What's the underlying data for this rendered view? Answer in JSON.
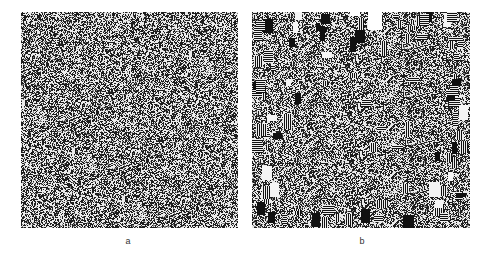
{
  "figure": {
    "panels": [
      {
        "id": "a",
        "label": "a",
        "pattern": "uniform-random-binary-noise",
        "cell_px": 1,
        "gray_levels": [
          "#1a1a1a",
          "#7a7a7a",
          "#e6e6e6"
        ]
      },
      {
        "id": "b",
        "label": "b",
        "pattern": "random-noise-with-striped-block-artifacts",
        "cell_px": 1,
        "block_density_edges": "high",
        "block_density_center": "low",
        "gray_levels": [
          "#111111",
          "#808080",
          "#f2f2f2"
        ]
      }
    ]
  }
}
